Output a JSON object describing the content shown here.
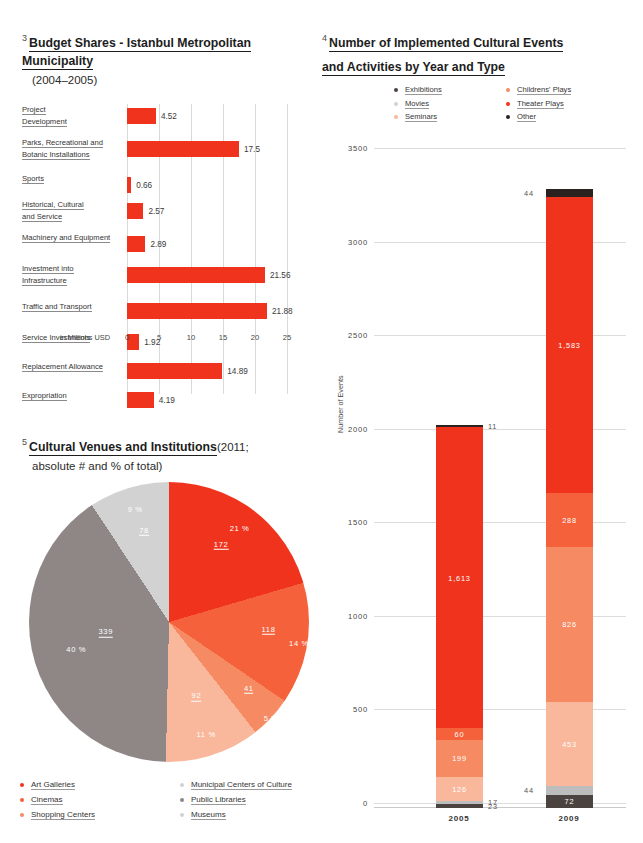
{
  "bar_section": {
    "fignum": "3",
    "title": "Budget Shares - Istanbul Metropolitan Municipality",
    "subtitle": "(2004–2005)",
    "axis_title": "in Millions USD"
  },
  "pie_section": {
    "fignum": "5",
    "title": "Cultural Venues and Institutions",
    "subtitle_a": "(2011;",
    "subtitle_b": "absolute # and % of total)"
  },
  "stack_section": {
    "fignum": "4",
    "title_line1": "Number of Implemented Cultural Events",
    "title_line2": "and Activities by Year and Type"
  },
  "chart_data": [
    {
      "type": "bar",
      "id": "budget-shares",
      "title": "Budget Shares - Istanbul Metropolitan Municipality (2004–2005)",
      "orientation": "horizontal",
      "xlabel": "in Millions USD",
      "ylabel": "",
      "xlim": [
        0,
        25
      ],
      "xticks": [
        "0",
        "5",
        "10",
        "15",
        "20",
        "25"
      ],
      "grid": true,
      "color": "#f0331d",
      "categories": [
        "Project Development",
        "Parks, Recreational and Botanic Installations",
        "Sports",
        "Historical, Cultural and Service",
        "Machinery and Equipment",
        "Investment into Infrastructure",
        "Traffic and Transport",
        "Service Investments",
        "Replacement Allowance",
        "Expropriation"
      ],
      "category_lines": [
        [
          "Project",
          "Development"
        ],
        [
          "Parks, Recreational and",
          "Botanic Installations"
        ],
        [
          "Sports"
        ],
        [
          "Historical, Cultural",
          "and Service"
        ],
        [
          "Machinery and Equipment"
        ],
        [
          "Investment into",
          "Infrastructure"
        ],
        [
          "Traffic and Transport"
        ],
        [
          "Service Investments"
        ],
        [
          "Replacement Allowance"
        ],
        [
          "Expropriation"
        ]
      ],
      "values": [
        4.52,
        17.5,
        0.66,
        2.57,
        2.89,
        21.56,
        21.88,
        1.92,
        14.89,
        4.19
      ],
      "value_labels": [
        "4.52",
        "17.5",
        "0.66",
        "2.57",
        "2.89",
        "21.56",
        "21.88",
        "1.92",
        "14.89",
        "4.19"
      ]
    },
    {
      "type": "pie",
      "id": "cultural-venues",
      "title": "Cultural Venues and Institutions (2011; absolute # and % of total)",
      "legend_position": "bottom",
      "labels": [
        "Art Galleries",
        "Cinemas",
        "Shopping Centers",
        "Municipal Centers of Culture",
        "Public Libraries",
        "Museums"
      ],
      "values": [
        172,
        118,
        41,
        92,
        339,
        78
      ],
      "value_labels": [
        "172",
        "118",
        "41",
        "92",
        "339",
        "78"
      ],
      "percent_labels": [
        "21 %",
        "14 %",
        "5 %",
        "11 %",
        "40 %",
        "9 %"
      ],
      "colors": [
        "#f0331d",
        "#f4613a",
        "#f58a63",
        "#f9b79b",
        "#8e8785",
        "#d2d2d2"
      ]
    },
    {
      "type": "bar",
      "subtype": "stacked",
      "id": "cultural-events",
      "title": "Number of Implemented Cultural Events and Activities by Year and Type",
      "ylabel": "Number of Events",
      "ylim": [
        0,
        3500
      ],
      "yticks": [
        "0",
        "500",
        "1000",
        "1500",
        "2000",
        "2500",
        "3000",
        "3500"
      ],
      "grid": true,
      "categories": [
        "2005",
        "2009"
      ],
      "series": [
        {
          "name": "Exhibitions",
          "color": "#f0331d",
          "values": [
            1613,
            1583
          ],
          "labels": [
            "1,613",
            "1,583"
          ]
        },
        {
          "name": "Childrens' Plays",
          "color": "#f4613a",
          "values": [
            60,
            288
          ],
          "labels": [
            "60",
            "288"
          ]
        },
        {
          "name": "Movies",
          "color": "#f58a63",
          "values": [
            199,
            826
          ],
          "labels": [
            "199",
            "826"
          ]
        },
        {
          "name": "Theater Plays",
          "color": "#f9b79b",
          "values": [
            126,
            453
          ],
          "labels": [
            "126",
            "453"
          ]
        },
        {
          "name": "Seminars",
          "color": "#bdbdbd",
          "values": [
            17,
            44
          ],
          "labels": [
            "17",
            "44"
          ]
        },
        {
          "name": "Concerts",
          "color": "#4a4340",
          "values": [
            23,
            72
          ],
          "labels": [
            "23",
            "72"
          ]
        },
        {
          "name": "Other",
          "color": "#2b211f",
          "values": [
            11,
            44
          ],
          "labels": [
            "11",
            "44"
          ]
        }
      ],
      "totals": [
        2049,
        3310
      ]
    }
  ],
  "legends": {
    "stack": [
      {
        "label": "Exhibitions",
        "color": "#4a4340"
      },
      {
        "label": "Childrens' Plays",
        "color": "#f58a63"
      },
      {
        "label": "Movies",
        "color": "#d2d2d2"
      },
      {
        "label": "Theater Plays",
        "color": "#f0331d"
      },
      {
        "label": "Seminars",
        "color": "#f9b79b"
      },
      {
        "label": "Other",
        "color": "#2b211f"
      }
    ],
    "pie": [
      {
        "label": "Art Galleries",
        "color": "#f0331d"
      },
      {
        "label": "Municipal Centers of Culture",
        "color": "#d2d2d2"
      },
      {
        "label": "Cinemas",
        "color": "#f4613a"
      },
      {
        "label": "Public Libraries",
        "color": "#8e8785"
      },
      {
        "label": "Shopping Centers",
        "color": "#f58a63"
      },
      {
        "label": "Museums",
        "color": "#d2d2d2"
      }
    ]
  }
}
